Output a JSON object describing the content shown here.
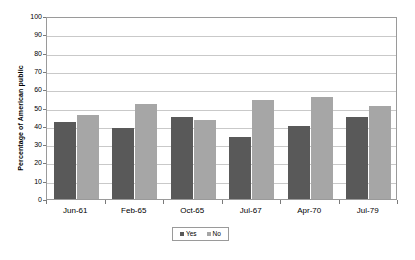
{
  "chart_data": {
    "type": "bar",
    "title": "",
    "subtitle": "",
    "xlabel": "",
    "ylabel": "Percentage of American public",
    "categories": [
      "Jun-61",
      "Feb-65",
      "Oct-65",
      "Jul-67",
      "Apr-70",
      "Jul-79"
    ],
    "series": [
      {
        "name": "Yes",
        "color": "#595959",
        "values": [
          42,
          39,
          45,
          34,
          40,
          45
        ]
      },
      {
        "name": "No",
        "color": "#a6a6a6",
        "values": [
          46,
          52,
          43,
          54,
          56,
          51
        ]
      }
    ],
    "ylim": [
      0,
      100
    ],
    "ytick_step": 10,
    "ytick_labels": [
      "0",
      "10",
      "20",
      "30",
      "40",
      "50",
      "60",
      "70",
      "80",
      "90",
      "100"
    ],
    "grid": true,
    "grid_axis": "y",
    "legend_position": "bottom",
    "plot_border_color": "#9a9a9a",
    "gridline_color": "#c9c9c9",
    "background_color": "#ffffff"
  },
  "legend": {
    "entries": [
      {
        "marker": "legend-swatch-yes",
        "label": "Yes"
      },
      {
        "marker": "legend-swatch-no",
        "label": "No"
      }
    ]
  }
}
